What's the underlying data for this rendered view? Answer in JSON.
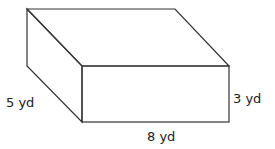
{
  "figure": {
    "type": "rectangular-prism",
    "labels": {
      "depth": "5 yd",
      "height": "3 yd",
      "length": "8 yd"
    },
    "stroke_color": "#333333"
  }
}
